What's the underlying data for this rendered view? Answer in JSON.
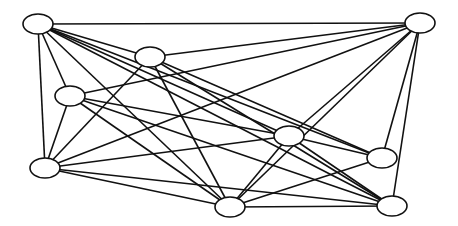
{
  "diagram": {
    "type": "undirected-graph",
    "width": 458,
    "height": 226,
    "node_rx": 15,
    "node_ry": 10,
    "colors": {
      "stroke": "#111111",
      "node_fill": "#ffffff",
      "background": "#ffffff"
    },
    "nodes": [
      {
        "id": "A",
        "x": 38,
        "y": 24
      },
      {
        "id": "B",
        "x": 150,
        "y": 57
      },
      {
        "id": "C",
        "x": 70,
        "y": 96
      },
      {
        "id": "D",
        "x": 420,
        "y": 23
      },
      {
        "id": "E",
        "x": 45,
        "y": 168
      },
      {
        "id": "F",
        "x": 230,
        "y": 207
      },
      {
        "id": "G",
        "x": 289,
        "y": 136
      },
      {
        "id": "H",
        "x": 382,
        "y": 158
      },
      {
        "id": "I",
        "x": 392,
        "y": 206
      }
    ],
    "edges": [
      [
        "A",
        "D"
      ],
      [
        "A",
        "B"
      ],
      [
        "A",
        "C"
      ],
      [
        "A",
        "E"
      ],
      [
        "A",
        "F"
      ],
      [
        "A",
        "G"
      ],
      [
        "A",
        "H"
      ],
      [
        "A",
        "I"
      ],
      [
        "B",
        "D"
      ],
      [
        "B",
        "E"
      ],
      [
        "B",
        "F"
      ],
      [
        "B",
        "H"
      ],
      [
        "B",
        "I"
      ],
      [
        "C",
        "D"
      ],
      [
        "C",
        "E"
      ],
      [
        "C",
        "F"
      ],
      [
        "C",
        "G"
      ],
      [
        "C",
        "I"
      ],
      [
        "D",
        "E"
      ],
      [
        "D",
        "F"
      ],
      [
        "D",
        "G"
      ],
      [
        "D",
        "H"
      ],
      [
        "D",
        "I"
      ],
      [
        "E",
        "G"
      ],
      [
        "E",
        "I"
      ],
      [
        "E",
        "F"
      ],
      [
        "F",
        "G"
      ],
      [
        "F",
        "H"
      ],
      [
        "F",
        "I"
      ],
      [
        "G",
        "H"
      ],
      [
        "G",
        "I"
      ]
    ]
  }
}
